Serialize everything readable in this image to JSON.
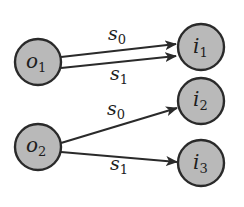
{
  "diagram": {
    "nodes": [
      {
        "id": "o1",
        "base": "o",
        "sub": "1"
      },
      {
        "id": "o2",
        "base": "o",
        "sub": "2"
      },
      {
        "id": "i1",
        "base": "i",
        "sub": "1"
      },
      {
        "id": "i2",
        "base": "i",
        "sub": "2"
      },
      {
        "id": "i3",
        "base": "i",
        "sub": "3"
      }
    ],
    "edges": [
      {
        "from": "o1",
        "to": "i1",
        "base": "s",
        "sub": "0"
      },
      {
        "from": "o1",
        "to": "i1",
        "base": "s",
        "sub": "1"
      },
      {
        "from": "o2",
        "to": "i2",
        "base": "s",
        "sub": "0"
      },
      {
        "from": "o2",
        "to": "i3",
        "base": "s",
        "sub": "1"
      }
    ],
    "colors": {
      "node_fill": "#b9b9b9",
      "stroke": "#2a2a2a",
      "text": "#1e1e1e"
    }
  }
}
